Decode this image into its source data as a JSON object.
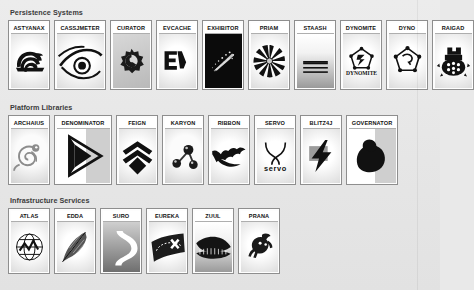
{
  "page": {
    "background_color": "#e9e9e9",
    "card_background": "#ffffff",
    "card_border_color": "#8e8e8e",
    "label_text_color": "#121212",
    "section_title_color": "#3b3b3b"
  },
  "sections": [
    {
      "id": "persistence-systems",
      "title": "Persistence Systems",
      "cards": [
        {
          "label": "ASTYANAX",
          "icon": "spartan-helmet-icon",
          "art": "astyanax",
          "bg": "bg-vig",
          "width": "normal"
        },
        {
          "label": "CASSJMETER",
          "icon": "eye-icon",
          "art": "cassjmeter",
          "bg": "bg-vig",
          "width": "wide"
        },
        {
          "label": "CURATOR",
          "icon": "gear-icon",
          "art": "curator",
          "bg": "bg-grey",
          "width": "normal"
        },
        {
          "label": "EVCACHE",
          "icon": "ev-monogram-icon",
          "art": "evcache",
          "bg": "bg-vig",
          "width": "normal"
        },
        {
          "label": "EXHIBITOR",
          "icon": "sparkle-trail-icon",
          "art": "exhibitor",
          "bg": "bg-black",
          "width": "normal"
        },
        {
          "label": "PRIAM",
          "icon": "starburst-icon",
          "art": "priam",
          "bg": "bg-vig",
          "width": "normal"
        },
        {
          "label": "STAASH",
          "icon": "stacked-disks-icon",
          "art": "staash",
          "bg": "bg-fade",
          "width": "normal"
        },
        {
          "label": "DYNOMITE",
          "icon": "dynamite-badge-icon",
          "art": "dynomite",
          "bg": "bg-vig",
          "width": "normal"
        },
        {
          "label": "DYNO",
          "icon": "molecule-node-icon",
          "art": "dyno",
          "bg": "bg-vig",
          "width": "normal"
        },
        {
          "label": "RAIGAD",
          "icon": "fortress-turtle-icon",
          "art": "raigad",
          "bg": "bg-vig",
          "width": "normal"
        }
      ]
    },
    {
      "id": "platform-libraries",
      "title": "Platform Libraries",
      "cards": [
        {
          "label": "ARCHAIUS",
          "icon": "chameleon-icon",
          "art": "archaius",
          "bg": "bg-soft",
          "width": "normal"
        },
        {
          "label": "DENOMINATOR",
          "icon": "triangle-arrow-icon",
          "art": "denominator",
          "bg": "bg-halfg",
          "width": "xwide"
        },
        {
          "label": "FEIGN",
          "icon": "chevrons-icon",
          "art": "feign",
          "bg": "bg-vig",
          "width": "normal"
        },
        {
          "label": "KARYON",
          "icon": "atom-spheres-icon",
          "art": "karyon",
          "bg": "bg-soft",
          "width": "normal"
        },
        {
          "label": "RIBBON",
          "icon": "ribbon-bat-icon",
          "art": "ribbon",
          "bg": "bg-vig",
          "width": "normal"
        },
        {
          "label": "SERVO",
          "icon": "servo-wordmark-icon",
          "art": "servo",
          "bg": "bg-vig",
          "width": "normal"
        },
        {
          "label": "BLITZ4J",
          "icon": "lightning-bolt-icon",
          "art": "blitz4j",
          "bg": "bg-vig",
          "width": "normal"
        },
        {
          "label": "GOVERNATOR",
          "icon": "flexed-arm-icon",
          "art": "governator",
          "bg": "bg-halfg",
          "width": "wide"
        }
      ]
    },
    {
      "id": "infrastructure-services",
      "title": "Infrastructure Services",
      "cards": [
        {
          "label": "ATLAS",
          "icon": "globe-chart-icon",
          "art": "atlas",
          "bg": "bg-vig",
          "width": "normal"
        },
        {
          "label": "EDDA",
          "icon": "feather-icon",
          "art": "edda",
          "bg": "bg-vig",
          "width": "normal"
        },
        {
          "label": "SURO",
          "icon": "winding-road-icon",
          "art": "suro",
          "bg": "bg-dark2",
          "width": "normal"
        },
        {
          "label": "EUREKA",
          "icon": "treasure-map-icon",
          "art": "eureka",
          "bg": "bg-vig",
          "width": "normal"
        },
        {
          "label": "ZUUL",
          "icon": "gatekeeper-icon",
          "art": "zuul",
          "bg": "bg-fade",
          "width": "normal"
        },
        {
          "label": "PRANA",
          "icon": "monkey-icon",
          "art": "prana",
          "bg": "bg-vig",
          "width": "normal"
        }
      ]
    }
  ]
}
